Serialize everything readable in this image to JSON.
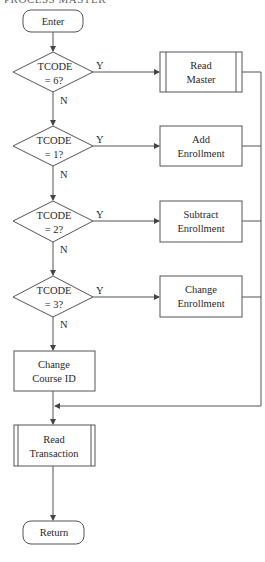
{
  "header": {
    "cut_text": "PROCESS MASTER"
  },
  "nodes": {
    "enter": {
      "type": "terminator",
      "label": "Enter"
    },
    "d1": {
      "type": "decision",
      "line1": "TCODE",
      "line2": "=  6?"
    },
    "d2": {
      "type": "decision",
      "line1": "TCODE",
      "line2": "= 1?"
    },
    "d3": {
      "type": "decision",
      "line1": "TCODE",
      "line2": "= 2?"
    },
    "d4": {
      "type": "decision",
      "line1": "TCODE",
      "line2": "= 3?"
    },
    "read_master": {
      "type": "predefined-process",
      "line1": "Read",
      "line2": "Master"
    },
    "add_enrollment": {
      "type": "process",
      "line1": "Add",
      "line2": "Enrollment"
    },
    "subtract_enrollment": {
      "type": "process",
      "line1": "Subtract",
      "line2": "Enrollment"
    },
    "change_enrollment": {
      "type": "process",
      "line1": "Change",
      "line2": "Enrollment"
    },
    "change_course_id": {
      "type": "process",
      "line1": "Change",
      "line2": "Course ID"
    },
    "read_transaction": {
      "type": "predefined-process",
      "line1": "Read",
      "line2": "Transaction"
    },
    "return": {
      "type": "terminator",
      "label": "Return"
    }
  },
  "edges": {
    "yes_label": "Y",
    "no_label": "N"
  },
  "colors": {
    "stroke": "#555555",
    "text": "#2a2a2a",
    "background": "#ffffff"
  }
}
